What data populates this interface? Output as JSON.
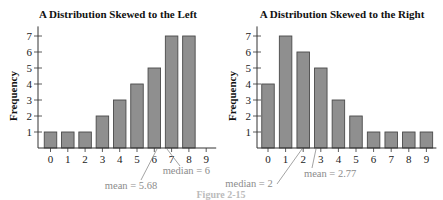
{
  "chart_data": [
    {
      "type": "bar",
      "title": "A Distribution Skewed to the Left",
      "xlabel": "",
      "ylabel": "Frequency",
      "categories": [
        "0",
        "1",
        "2",
        "3",
        "4",
        "5",
        "6",
        "7",
        "8",
        "9"
      ],
      "values": [
        1,
        1,
        1,
        2,
        3,
        4,
        5,
        7,
        7,
        0
      ],
      "yticks": [
        1,
        2,
        3,
        4,
        5,
        6,
        7
      ],
      "ylim": [
        0,
        7.5
      ],
      "grid": false,
      "annotations": [
        {
          "text": "median = 6",
          "x": 6
        },
        {
          "text": "mean = 5.68",
          "x": 5.68
        }
      ]
    },
    {
      "type": "bar",
      "title": "A Distribution Skewed to the Right",
      "xlabel": "",
      "ylabel": "Frequency",
      "categories": [
        "0",
        "1",
        "2",
        "3",
        "4",
        "5",
        "6",
        "7",
        "8",
        "9"
      ],
      "values": [
        4,
        7,
        6,
        5,
        3,
        2,
        1,
        1,
        1,
        1
      ],
      "yticks": [
        1,
        2,
        3,
        4,
        5,
        6,
        7
      ],
      "ylim": [
        0,
        7.5
      ],
      "grid": false,
      "annotations": [
        {
          "text": "median = 2",
          "x": 2
        },
        {
          "text": "mean = 2.77",
          "x": 2.77
        }
      ]
    }
  ],
  "caption": "Figure 2-15",
  "colors": {
    "bar_fill": "#8f8f8f",
    "bar_stroke": "#4a4a4a",
    "axis": "#333333",
    "annotation": "#8c8c8c"
  }
}
